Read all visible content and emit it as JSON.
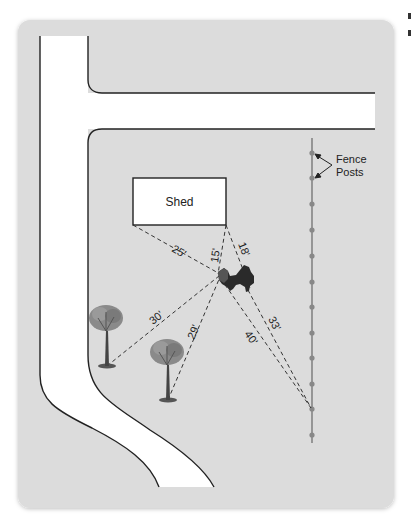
{
  "diagram": {
    "shed_label": "Shed",
    "fence_label_line1": "Fence",
    "fence_label_line2": "Posts",
    "measurements": {
      "shed_left_to_dog": "25'",
      "shed_right_to_dog_front": "15'",
      "shed_right_to_dog_back": "18'",
      "tree1_to_dog": "30'",
      "tree2_to_dog": "29'",
      "fence_to_dog_front": "40'",
      "fence_to_dog_back": "33'"
    },
    "colors": {
      "card_bg": "#dcdcdc",
      "road": "#ffffff",
      "line": "#222222",
      "fence": "#777777",
      "fence_post": "#888888",
      "dog": "#2a2a2a",
      "tree_canopy": "#8a8a8a",
      "tree_trunk": "#444444"
    }
  }
}
